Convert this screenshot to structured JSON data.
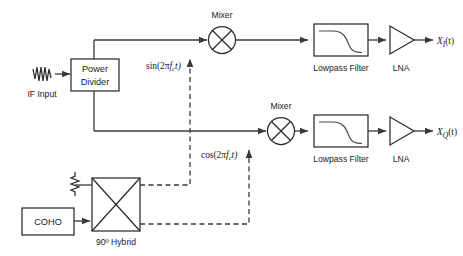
{
  "diagram": {
    "colors": {
      "line": "#3a3a3a",
      "block_stroke": "#2b2b2b",
      "text": "#1a1a1a",
      "background": "#ffffff"
    },
    "input": {
      "signal_icon": "sine-waveform-icon",
      "label": "IF Input"
    },
    "power_divider": {
      "line1": "Power",
      "line2": "Divider"
    },
    "mixers": [
      {
        "label": "Mixer",
        "icon": "mixer-circle-x-icon"
      },
      {
        "label": "Mixer",
        "icon": "mixer-circle-x-icon"
      }
    ],
    "lo_signals": [
      {
        "text": "sin(2πfᴄt)",
        "prefix": "sin(2π",
        "var": "f",
        "sub": "c",
        "suffix": "t)"
      },
      {
        "text": "cos(2πfᴄt)",
        "prefix": "cos(2π",
        "var": "f",
        "sub": "c",
        "suffix": "t)"
      }
    ],
    "filters": [
      {
        "label": "Lowpass Filter",
        "icon": "lowpass-response-curve-icon"
      },
      {
        "label": "Lowpass Filter",
        "icon": "lowpass-response-curve-icon"
      }
    ],
    "amplifiers": [
      {
        "label": "LNA",
        "icon": "amplifier-triangle-icon"
      },
      {
        "label": "LNA",
        "icon": "amplifier-triangle-icon"
      }
    ],
    "outputs": [
      {
        "base": "X",
        "sub": "I",
        "arg": "(t)"
      },
      {
        "base": "X",
        "sub": "Q",
        "arg": "(t)"
      }
    ],
    "hybrid": {
      "label": "90º Hybrid",
      "icon": "hybrid-coupler-box-x-icon",
      "termination_icon": "resistor-termination-icon"
    },
    "coho": {
      "label": "COHO"
    }
  }
}
